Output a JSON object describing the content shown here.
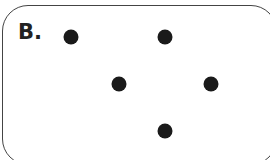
{
  "label": "B.",
  "colors": {
    "dot": "#1a1a1a",
    "border": "#444444"
  },
  "dots": [
    {
      "x": 71,
      "y": 37
    },
    {
      "x": 165,
      "y": 37
    },
    {
      "x": 119,
      "y": 84
    },
    {
      "x": 211,
      "y": 84
    },
    {
      "x": 165,
      "y": 131
    }
  ]
}
